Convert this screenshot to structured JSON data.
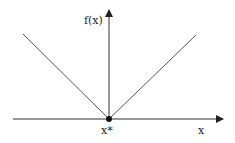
{
  "diagram": {
    "title": "",
    "y_axis_label": "f(x)",
    "x_axis_label": "x",
    "point_label": "x*",
    "colors": {
      "line": "#555555",
      "axis": "#222222",
      "point": "#111111"
    },
    "function": "absolute value |x - x*|, non-differentiable minimum at x*"
  }
}
